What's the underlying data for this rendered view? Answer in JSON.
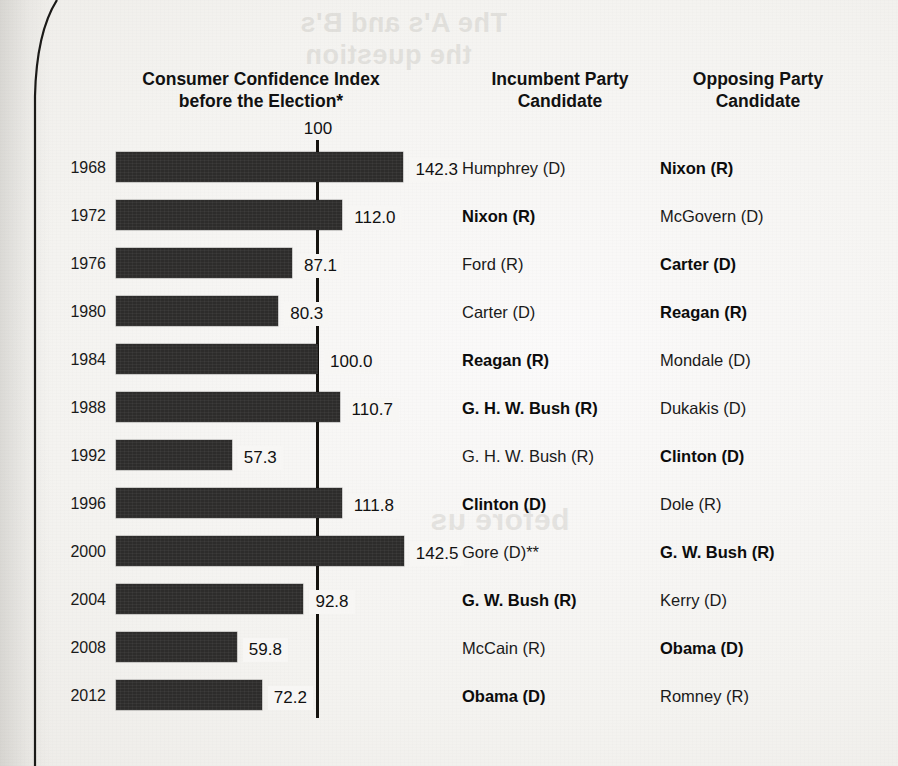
{
  "headers": {
    "index_line1": "Consumer Confidence Index",
    "index_line2": "before the Election*",
    "incumbent_line1": "Incumbent Party",
    "incumbent_line2": "Candidate",
    "opposing_line1": "Opposing Party",
    "opposing_line2": "Candidate"
  },
  "axis": {
    "reference_tick_label": "100"
  },
  "bleed_through": {
    "line1": "The A's and B's",
    "line2": "the question",
    "line3": "before us"
  },
  "colors": {
    "bar": "#2d2c2b",
    "reference_line": "#15130f",
    "page": "#f4f3f0",
    "text": "#111111"
  },
  "chart_data": {
    "type": "bar",
    "title": "Consumer Confidence Index before the Election*",
    "orientation": "horizontal",
    "xlabel": "",
    "ylabel": "",
    "xlim": [
      0,
      150
    ],
    "reference_line": 100,
    "grid": false,
    "legend": null,
    "categories": [
      "1968",
      "1972",
      "1976",
      "1980",
      "1984",
      "1988",
      "1992",
      "1996",
      "2000",
      "2004",
      "2008",
      "2012"
    ],
    "values": [
      142.3,
      112.0,
      87.1,
      80.3,
      100.0,
      110.7,
      57.3,
      111.8,
      142.5,
      92.8,
      59.8,
      72.2
    ],
    "value_labels": [
      "142.3",
      "112.0",
      "87.1",
      "80.3",
      "100.0",
      "110.7",
      "57.3",
      "111.8",
      "142.5",
      "92.8",
      "59.8",
      "72.2"
    ],
    "annotations": {
      "footnote_marker_title": "*",
      "footnote_marker_gore": "**"
    }
  },
  "rows": [
    {
      "year": "1968",
      "value": 142.3,
      "value_label": "142.3",
      "incumbent": "Humphrey (D)",
      "incumbent_won": false,
      "opposing": "Nixon (R)",
      "opposing_won": true
    },
    {
      "year": "1972",
      "value": 112.0,
      "value_label": "112.0",
      "incumbent": "Nixon (R)",
      "incumbent_won": true,
      "opposing": "McGovern (D)",
      "opposing_won": false
    },
    {
      "year": "1976",
      "value": 87.1,
      "value_label": "87.1",
      "incumbent": "Ford (R)",
      "incumbent_won": false,
      "opposing": "Carter (D)",
      "opposing_won": true
    },
    {
      "year": "1980",
      "value": 80.3,
      "value_label": "80.3",
      "incumbent": "Carter (D)",
      "incumbent_won": false,
      "opposing": "Reagan (R)",
      "opposing_won": true
    },
    {
      "year": "1984",
      "value": 100.0,
      "value_label": "100.0",
      "incumbent": "Reagan (R)",
      "incumbent_won": true,
      "opposing": "Mondale (D)",
      "opposing_won": false
    },
    {
      "year": "1988",
      "value": 110.7,
      "value_label": "110.7",
      "incumbent": "G. H. W. Bush (R)",
      "incumbent_won": true,
      "opposing": "Dukakis (D)",
      "opposing_won": false
    },
    {
      "year": "1992",
      "value": 57.3,
      "value_label": "57.3",
      "incumbent": "G. H. W. Bush (R)",
      "incumbent_won": false,
      "opposing": "Clinton (D)",
      "opposing_won": true
    },
    {
      "year": "1996",
      "value": 111.8,
      "value_label": "111.8",
      "incumbent": "Clinton (D)",
      "incumbent_won": true,
      "opposing": "Dole (R)",
      "opposing_won": false
    },
    {
      "year": "2000",
      "value": 142.5,
      "value_label": "142.5",
      "incumbent": "Gore (D)**",
      "incumbent_won": false,
      "opposing": "G. W. Bush (R)",
      "opposing_won": true
    },
    {
      "year": "2004",
      "value": 92.8,
      "value_label": "92.8",
      "incumbent": "G. W. Bush (R)",
      "incumbent_won": true,
      "opposing": "Kerry (D)",
      "opposing_won": false
    },
    {
      "year": "2008",
      "value": 59.8,
      "value_label": "59.8",
      "incumbent": "McCain (R)",
      "incumbent_won": false,
      "opposing": "Obama (D)",
      "opposing_won": true
    },
    {
      "year": "2012",
      "value": 72.2,
      "value_label": "72.2",
      "incumbent": "Obama (D)",
      "incumbent_won": true,
      "opposing": "Romney (R)",
      "opposing_won": false
    }
  ],
  "layout": {
    "bar_origin_x": 116,
    "px_per_unit": 2.02,
    "row_top": 148,
    "row_pitch": 48
  }
}
